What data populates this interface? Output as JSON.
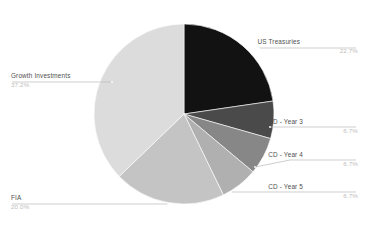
{
  "chart_data": {
    "type": "pie",
    "title": "",
    "subtitle": "",
    "xlabel": "",
    "ylabel": "",
    "legend_position": "callout-labels",
    "grid": false,
    "start_angle_deg": 0,
    "direction": "clockwise",
    "units": "percent",
    "total": 100.0,
    "categories": [
      "US Treasuries",
      "CD - Year 3",
      "CD - Year 4",
      "CD - Year 5",
      "FIA",
      "Growth Investments"
    ],
    "values": [
      22.7,
      6.7,
      6.7,
      6.7,
      20.0,
      37.2
    ],
    "value_labels": [
      "22.7%",
      "6.7%",
      "6.7%",
      "6.7%",
      "20.0%",
      "37.2%"
    ],
    "colors": [
      "#121212",
      "#4a4a4a",
      "#878787",
      "#b0b0b0",
      "#c4c4c4",
      "#dcdcdc"
    ],
    "slices": [
      {
        "name": "US Treasuries",
        "value": 22.7,
        "value_label": "22.7%",
        "color": "#121212",
        "label_side": "right",
        "label_x": 300,
        "label_y": 44,
        "pct_x": 358,
        "pct_y": 52.5,
        "leader": "M 259 48 L 286 48 L 356 48",
        "dot_x": 259,
        "dot_y": 48
      },
      {
        "name": "CD - Year 3",
        "value": 6.7,
        "value_label": "6.7%",
        "color": "#4a4a4a",
        "label_side": "right",
        "label_x": 303,
        "label_y": 124,
        "pct_x": 358,
        "pct_y": 132.5,
        "leader": "M 270 127 L 290 127 L 356 127",
        "dot_x": 270,
        "dot_y": 127
      },
      {
        "name": "CD - Year 4",
        "value": 6.7,
        "value_label": "6.7%",
        "color": "#878787",
        "label_side": "right",
        "label_x": 303,
        "label_y": 157,
        "pct_x": 358,
        "pct_y": 165.5,
        "leader": "M 255 167 L 290 160 L 356 160",
        "dot_x": 255,
        "dot_y": 167
      },
      {
        "name": "CD - Year 5",
        "value": 6.7,
        "value_label": "6.7%",
        "color": "#b0b0b0",
        "label_side": "right",
        "label_x": 303,
        "label_y": 189,
        "pct_x": 358,
        "pct_y": 197.5,
        "leader": "M 231 192 L 290 192 L 356 192",
        "dot_x": 231,
        "dot_y": 192
      },
      {
        "name": "FIA",
        "value": 20.0,
        "value_label": "20.0%",
        "color": "#c4c4c4",
        "label_side": "left",
        "label_x": 11,
        "label_y": 200,
        "pct_x": 11,
        "pct_y": 208.5,
        "leader": "M 168 204 L 60 204 L 12 204",
        "dot_x": 168,
        "dot_y": 204
      },
      {
        "name": "Growth Investments",
        "value": 37.2,
        "value_label": "37.2%",
        "color": "#dcdcdc",
        "label_side": "left",
        "label_x": 11,
        "label_y": 78,
        "pct_x": 11,
        "pct_y": 86.5,
        "leader": "M 112 82 L 60 82 L 12 82",
        "dot_x": 112,
        "dot_y": 82
      }
    ],
    "geometry": {
      "center_x": 184,
      "center_y": 114,
      "radius": 90
    },
    "background_color": "#ffffff"
  }
}
